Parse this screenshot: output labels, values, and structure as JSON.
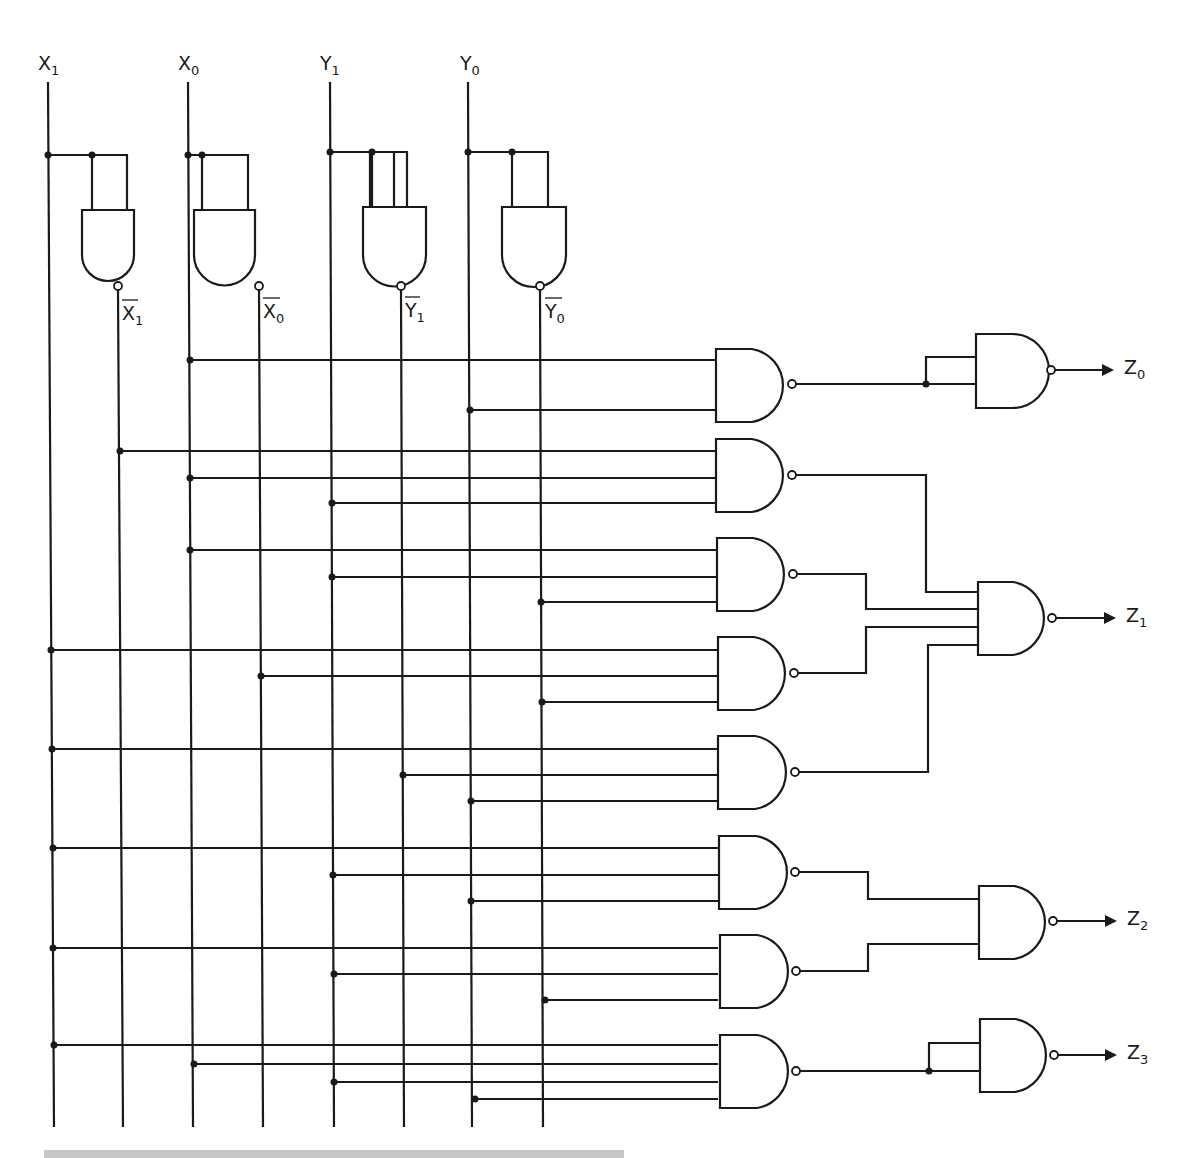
{
  "diagram": {
    "type": "logic-circuit",
    "inputs": [
      {
        "name": "X",
        "sub": "1",
        "x": 50
      },
      {
        "name": "X",
        "sub": "0",
        "x": 190
      },
      {
        "name": "Y",
        "sub": "1",
        "x": 330
      },
      {
        "name": "Y",
        "sub": "0",
        "x": 470
      }
    ],
    "inverted_inputs": [
      {
        "name": "X",
        "sub": "1",
        "x": 120
      },
      {
        "name": "X",
        "sub": "0",
        "x": 260
      },
      {
        "name": "Y",
        "sub": "1",
        "x": 402
      },
      {
        "name": "Y",
        "sub": "0",
        "x": 542
      }
    ],
    "outputs": [
      {
        "name": "Z",
        "sub": "0",
        "y": 368
      },
      {
        "name": "Z",
        "sub": "1",
        "y": 618
      },
      {
        "name": "Z",
        "sub": "2",
        "y": 920
      },
      {
        "name": "Z",
        "sub": "3",
        "y": 1056
      }
    ],
    "first_level_gates": [
      {
        "id": "G1",
        "inputs": [
          "X0",
          "Y0"
        ],
        "output_to": "Z0 inverter"
      },
      {
        "id": "G2",
        "inputs": [
          "X1'",
          "X0",
          "Y1"
        ],
        "output_to": "Z1 gate"
      },
      {
        "id": "G3",
        "inputs": [
          "X0",
          "Y1",
          "Y0'"
        ],
        "output_to": "Z1 gate"
      },
      {
        "id": "G4",
        "inputs": [
          "X1",
          "X0'",
          "Y0'"
        ],
        "output_to": "Z1 gate"
      },
      {
        "id": "G5",
        "inputs": [
          "X1",
          "Y1'",
          "Y0"
        ],
        "output_to": "Z1 gate"
      },
      {
        "id": "G6",
        "inputs": [
          "X1",
          "Y1",
          "Y0"
        ],
        "output_to": "Z2 gate"
      },
      {
        "id": "G7",
        "inputs": [
          "X1",
          "X0",
          "Y0"
        ],
        "output_to": "Z2 gate"
      },
      {
        "id": "G8",
        "inputs": [
          "X1",
          "X0",
          "Y1",
          "Y0"
        ],
        "output_to": "Z3 inverter"
      }
    ]
  }
}
